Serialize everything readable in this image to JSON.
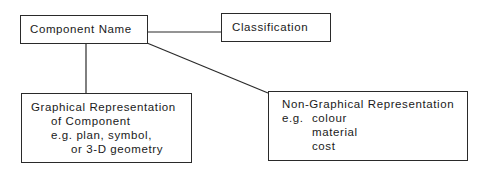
{
  "diagram": {
    "nodes": {
      "component_name": {
        "label": "Component Name"
      },
      "classification": {
        "label": "Classification"
      },
      "graphical": {
        "lines": [
          "Graphical Representation",
          "of Component",
          "e.g. plan, symbol,",
          "or 3-D geometry"
        ]
      },
      "non_graphical": {
        "title": "Non-Graphical Representation",
        "eg": "e.g.",
        "items": [
          "colour",
          "material",
          "cost"
        ]
      }
    },
    "edges": [
      {
        "from": "Component Name",
        "to": "Classification"
      },
      {
        "from": "Component Name",
        "to": "Graphical Representation of Component"
      },
      {
        "from": "Component Name",
        "to": "Non-Graphical Representation"
      }
    ],
    "colors": {
      "line": "#2a2a2a",
      "background": "#ffffff"
    }
  }
}
